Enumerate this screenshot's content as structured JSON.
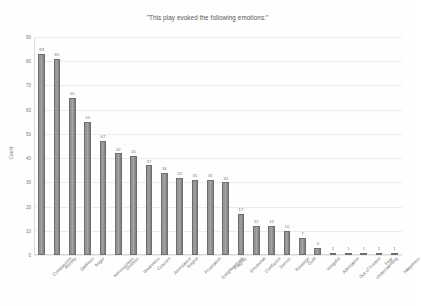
{
  "chart_data": {
    "type": "bar",
    "title": "\"This play evoked the following emotions:\"",
    "xlabel": "",
    "ylabel": "Count",
    "ylim": [
      0,
      90
    ],
    "yticks": [
      0,
      10,
      20,
      30,
      40,
      50,
      60,
      70,
      80,
      90
    ],
    "grid": true,
    "legend": false,
    "categories": [
      "Compassion",
      "Anxiety",
      "Sadness",
      "Anger",
      "Nervousness",
      "Distress",
      "Weariness",
      "Concern",
      "Annoyance",
      "Regret",
      "Frustration",
      "Enlightenment",
      "Fragility",
      "Emotional",
      "Confusion",
      "Sorrow",
      "Revenge",
      "Guilt",
      "Vengeful",
      "Admiration",
      "Out of Control",
      "Understanding",
      "Fear",
      "Happiness"
    ],
    "values": [
      83,
      81,
      65,
      55,
      47,
      42,
      41,
      37,
      34,
      32,
      31,
      31,
      30,
      17,
      12,
      12,
      10,
      7,
      3,
      1,
      1,
      1,
      1,
      1
    ],
    "bar_color": "#8e8e8e",
    "grid_color": "#ececec",
    "text_color": "#6f6f6f"
  }
}
